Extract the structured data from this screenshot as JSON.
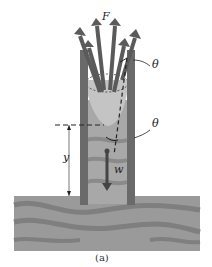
{
  "figure": {
    "labels": {
      "force": "F",
      "theta_top": "θ",
      "theta_bottom": "θ",
      "height": "y",
      "weight": "w"
    },
    "caption": "(a)",
    "colors": {
      "ground": "#9a9a9a",
      "ground_wave": "#7a7a7a",
      "tube_wall": "#6a6a6a",
      "liquid": "#a8a8a8",
      "meniscus": "#c4c4c4",
      "arrow": "#5a5a5a"
    }
  }
}
